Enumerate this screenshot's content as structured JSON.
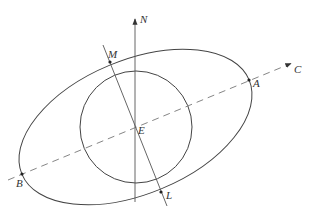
{
  "diagram": {
    "colors": {
      "stroke": "#444444",
      "background": "#ffffff"
    },
    "center": {
      "label": "E",
      "x": 135,
      "y": 126
    },
    "circle": {
      "cx": 136,
      "cy": 127,
      "r": 56
    },
    "ellipse": {
      "cx": 135.5,
      "cy": 127,
      "rx": 123,
      "ry": 67,
      "rotation_deg": -22.5
    },
    "axes": {
      "north": {
        "label": "N",
        "from": [
          135,
          202
        ],
        "to": [
          135,
          18
        ]
      },
      "dashed": {
        "label": "C",
        "from": [
          8,
          180
        ],
        "to": [
          291,
          63
        ]
      },
      "tilted": {
        "from": [
          103,
          45
        ],
        "to": [
          167,
          206
        ]
      }
    },
    "points": [
      {
        "label": "A",
        "x": 249,
        "y": 80,
        "lx": 254,
        "ly": 87
      },
      {
        "label": "B",
        "x": 22,
        "y": 174,
        "lx": 15,
        "ly": 187
      },
      {
        "label": "M",
        "x": 110,
        "y": 62,
        "lx": 108,
        "ly": 58
      },
      {
        "label": "L",
        "x": 161,
        "y": 192,
        "lx": 166,
        "ly": 199
      }
    ],
    "labels": {
      "N": "N",
      "C": "C",
      "E": "E",
      "A": "A",
      "B": "B",
      "M": "M",
      "L": "L"
    }
  }
}
